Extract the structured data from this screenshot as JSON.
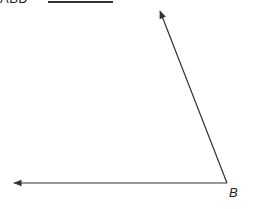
{
  "question": {
    "cut_off_text": "ABD",
    "answer_blank": ""
  },
  "diagram": {
    "type": "angle",
    "vertex_label": "B",
    "vertex": [
      227,
      183
    ],
    "rays": [
      {
        "name": "ray-up-left",
        "tip": [
          160,
          10
        ]
      },
      {
        "name": "ray-left",
        "tip": [
          13,
          183
        ]
      }
    ],
    "stroke_color": "#333333"
  }
}
